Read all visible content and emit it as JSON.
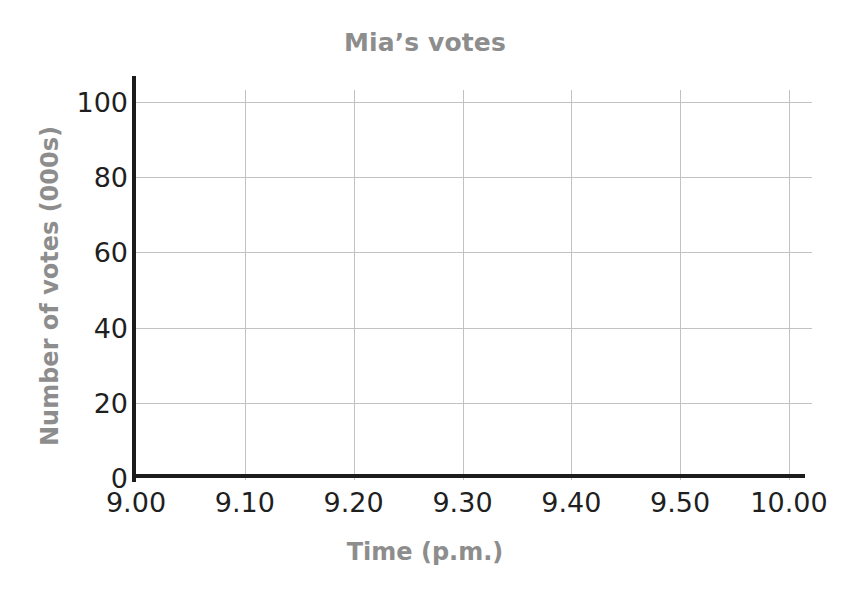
{
  "chart_data": {
    "type": "line",
    "title": "Mia’s votes",
    "xlabel": "Time (p.m.)",
    "ylabel": "Number of votes (000s)",
    "x_tick_labels": [
      "9.00",
      "9.10",
      "9.20",
      "9.30",
      "9.40",
      "9.50",
      "10.00"
    ],
    "x_tick_values": [
      0,
      10,
      20,
      30,
      40,
      50,
      60
    ],
    "y_tick_labels": [
      "0",
      "20",
      "40",
      "60",
      "80",
      "100"
    ],
    "y_tick_values": [
      0,
      20,
      40,
      60,
      80,
      100
    ],
    "xlim": [
      0,
      60
    ],
    "ylim": [
      0,
      100
    ],
    "grid": true,
    "legend": "none",
    "series": [],
    "values": [],
    "note": "Empty grid: no data series plotted; blank axes for plotting."
  },
  "style": {
    "background": "#ffffff",
    "title_color": "#8d8d8d",
    "axis_title_color": "#8d8d8d",
    "tick_label_color": "#1f1f1f",
    "axis_line_color": "#1c1c1c",
    "gridline_color": "#c2c2c2"
  }
}
